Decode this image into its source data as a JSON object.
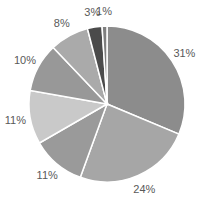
{
  "chart_data": {
    "type": "pie",
    "title": "",
    "start_angle_deg": 0,
    "direction": "clockwise",
    "legend": "none",
    "slices": [
      {
        "label": "31%",
        "value": 31,
        "color": "#8c8c8c"
      },
      {
        "label": "24%",
        "value": 24,
        "color": "#a6a6a6"
      },
      {
        "label": "11%",
        "value": 11,
        "color": "#9a9a9a"
      },
      {
        "label": "11%",
        "value": 11,
        "color": "#c9c9c9"
      },
      {
        "label": "10%",
        "value": 10,
        "color": "#989898"
      },
      {
        "label": "8%",
        "value": 8,
        "color": "#aaaaaa"
      },
      {
        "label": "3%",
        "value": 3,
        "color": "#4b4b4b"
      },
      {
        "label": "1%",
        "value": 1,
        "color": "#7f7f7f"
      }
    ]
  }
}
